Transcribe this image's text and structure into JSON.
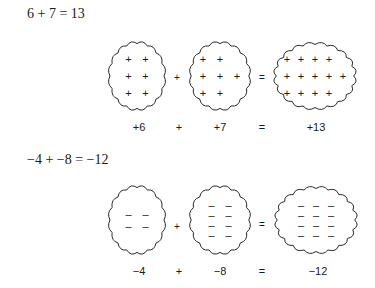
{
  "examples": [
    {
      "title": "6 + 7 = 13",
      "operator": "+",
      "equals": "=",
      "labels": {
        "a": "+6",
        "op": "+",
        "b": "+7",
        "eq": "=",
        "result": "+13"
      },
      "blobs": [
        {
          "name": "blob-plus-6",
          "symbol": "+",
          "count": 6,
          "rows": [
            2,
            2,
            2
          ]
        },
        {
          "name": "blob-plus-7",
          "symbol": "+",
          "count": 7,
          "rows": [
            2,
            3,
            2
          ]
        },
        {
          "name": "blob-plus-13",
          "symbol": "+",
          "count": 13,
          "rows": [
            4,
            5,
            4
          ]
        }
      ]
    },
    {
      "title": "−4 + −8 = −12",
      "operator": "+",
      "equals": "=",
      "labels": {
        "a": "−4",
        "op": "+",
        "b": "−8",
        "eq": "=",
        "result": "−12"
      },
      "blobs": [
        {
          "name": "blob-minus-4",
          "symbol": "–",
          "count": 4,
          "rows": [
            2,
            2
          ]
        },
        {
          "name": "blob-minus-8",
          "symbol": "–",
          "count": 8,
          "rows": [
            2,
            2,
            2,
            2
          ]
        },
        {
          "name": "blob-minus-12",
          "symbol": "–",
          "count": 12,
          "rows": [
            3,
            3,
            3,
            3
          ]
        }
      ]
    }
  ]
}
